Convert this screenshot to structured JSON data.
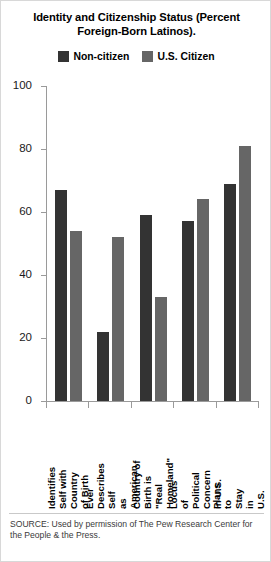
{
  "chart_data": {
    "type": "bar",
    "title": "Identity and Citizenship Status (Percent\nForeign-Born Latinos).",
    "xlabel": "",
    "ylabel": "",
    "ylim": [
      0,
      100
    ],
    "yticks": [
      0,
      20,
      40,
      60,
      80,
      100
    ],
    "grid": false,
    "legend_position": "top-center",
    "categories": [
      "Identifies Self with\nCountry of Birth",
      "Ever Describes Self\nas American",
      "Country of Birth is\n\"Real Homeland\"",
      "Locus of Political\nConcern in U.S.",
      "Plans to\nStay in U.S."
    ],
    "series": [
      {
        "name": "Non-citizen",
        "color": "#333333",
        "values": [
          67,
          22,
          59,
          57,
          69
        ]
      },
      {
        "name": "U.S. Citizen",
        "color": "#666666",
        "values": [
          54,
          52,
          33,
          64,
          81
        ]
      }
    ],
    "source": "SOURCE: Used by permission of The Pew Research Center for the People & the Press."
  }
}
